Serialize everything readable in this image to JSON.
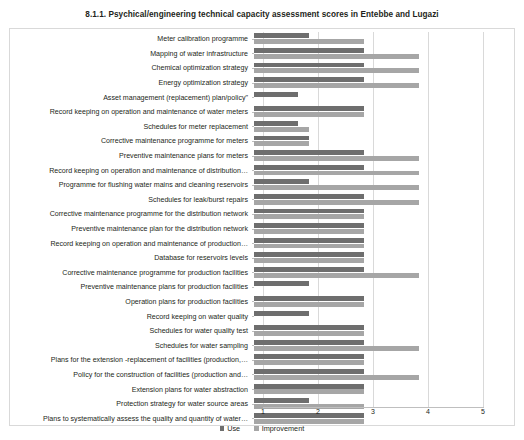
{
  "chart_data": {
    "type": "bar",
    "orientation": "horizontal",
    "title": "8.1.1. Psychical/engineering technical capacity assessment scores in Entebbe and Lugazi",
    "xlabel": "",
    "ylabel": "",
    "xlim": [
      1,
      5
    ],
    "xticks": [
      "1",
      "2",
      "3",
      "4",
      "5"
    ],
    "grid": true,
    "legend_position": "bottom",
    "colors": {
      "use": "#6e6e6e",
      "improvement": "#a6a6a6",
      "grid": "#d9d9d9",
      "frame": "#d9d9d9"
    },
    "categories": [
      "Meter calibration programme",
      "Mapping of water infrastructure",
      "Chemical optimization strategy",
      "Energy optimization strategy",
      "Asset management (replacement) plan/policy\"",
      "Record keeping on operation and maintenance of water meters",
      "Schedules for meter replacement",
      "Corrective maintenance programme for meters",
      "Preventive maintenance plans for meters",
      "Record keeping on operation and maintenance of distribution…",
      "Programme for flushing water mains and cleaning reservoirs",
      "Schedules for leak/burst repairs",
      "Corrective maintenance programme for the distribution network",
      "Preventive  maintenance plan for the distribution network",
      "Record keeping on operation and maintenance of production…",
      "Database for reservoirs levels",
      "Corrective maintenance programme for  production facilities",
      "Preventive maintenance plans for production facilities",
      "Operation plans for production facilities",
      "Record keeping on water quality",
      "Schedules for water quality test",
      "Schedules for water sampling",
      "Plans for the extension -replacement of facilities (production,…",
      "Policy for the construction of facilities (production and…",
      "Extension plans for water abstraction",
      "Protection strategy for water source areas",
      "Plans to systematically assess the  quality and quantity of water…"
    ],
    "series": [
      {
        "name": "Use",
        "color": "#6e6e6e",
        "values": [
          2,
          3,
          3,
          3,
          1.8,
          3,
          1.8,
          2,
          3,
          3,
          2,
          3,
          3,
          3,
          3,
          3,
          3,
          2,
          3,
          2,
          3,
          3,
          3,
          3,
          3,
          2,
          3
        ]
      },
      {
        "name": "Improvement",
        "color": "#a6a6a6",
        "values": [
          3,
          4,
          4,
          4,
          1,
          3,
          2,
          2,
          4,
          4,
          4,
          4,
          3,
          3,
          3,
          3,
          4,
          1,
          3,
          1,
          3,
          4,
          3,
          4,
          3,
          3,
          3
        ]
      }
    ]
  },
  "legend": {
    "items": [
      {
        "label": "Use"
      },
      {
        "label": "Improvement"
      }
    ]
  }
}
